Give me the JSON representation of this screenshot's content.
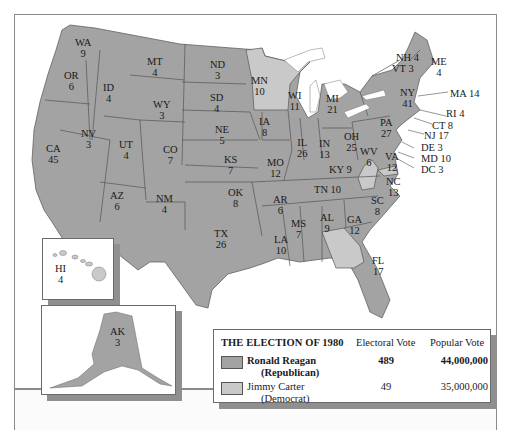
{
  "map": {
    "title": "THE ELECTION OF 1980",
    "colors": {
      "republican": "#a3a3a3",
      "democrat": "#c9c9c9",
      "water": "#ffffff",
      "border": "#555555"
    },
    "states": {
      "WA": {
        "abbr": "WA",
        "ev": "9",
        "winner": "Reagan"
      },
      "OR": {
        "abbr": "OR",
        "ev": "6",
        "winner": "Reagan"
      },
      "CA": {
        "abbr": "CA",
        "ev": "45",
        "winner": "Reagan"
      },
      "NV": {
        "abbr": "NV",
        "ev": "3",
        "winner": "Reagan"
      },
      "ID": {
        "abbr": "ID",
        "ev": "4",
        "winner": "Reagan"
      },
      "MT": {
        "abbr": "MT",
        "ev": "4",
        "winner": "Reagan"
      },
      "WY": {
        "abbr": "WY",
        "ev": "3",
        "winner": "Reagan"
      },
      "UT": {
        "abbr": "UT",
        "ev": "4",
        "winner": "Reagan"
      },
      "AZ": {
        "abbr": "AZ",
        "ev": "6",
        "winner": "Reagan"
      },
      "CO": {
        "abbr": "CO",
        "ev": "7",
        "winner": "Reagan"
      },
      "NM": {
        "abbr": "NM",
        "ev": "4",
        "winner": "Reagan"
      },
      "ND": {
        "abbr": "ND",
        "ev": "3",
        "winner": "Reagan"
      },
      "SD": {
        "abbr": "SD",
        "ev": "4",
        "winner": "Reagan"
      },
      "NE": {
        "abbr": "NE",
        "ev": "5",
        "winner": "Reagan"
      },
      "KS": {
        "abbr": "KS",
        "ev": "7",
        "winner": "Reagan"
      },
      "OK": {
        "abbr": "OK",
        "ev": "8",
        "winner": "Reagan"
      },
      "TX": {
        "abbr": "TX",
        "ev": "26",
        "winner": "Reagan"
      },
      "MN": {
        "abbr": "MN",
        "ev": "10",
        "winner": "Carter"
      },
      "IA": {
        "abbr": "IA",
        "ev": "8",
        "winner": "Reagan"
      },
      "MO": {
        "abbr": "MO",
        "ev": "12",
        "winner": "Reagan"
      },
      "AR": {
        "abbr": "AR",
        "ev": "6",
        "winner": "Reagan"
      },
      "LA": {
        "abbr": "LA",
        "ev": "10",
        "winner": "Reagan"
      },
      "WI": {
        "abbr": "WI",
        "ev": "11",
        "winner": "Reagan"
      },
      "IL": {
        "abbr": "IL",
        "ev": "26",
        "winner": "Reagan"
      },
      "MI": {
        "abbr": "MI",
        "ev": "21",
        "winner": "Reagan"
      },
      "IN": {
        "abbr": "IN",
        "ev": "13",
        "winner": "Reagan"
      },
      "OH": {
        "abbr": "OH",
        "ev": "25",
        "winner": "Reagan"
      },
      "KY": {
        "abbr": "KY",
        "label": "KY 9",
        "ev": "9",
        "winner": "Reagan"
      },
      "TN": {
        "abbr": "TN",
        "label": "TN 10",
        "ev": "10",
        "winner": "Reagan"
      },
      "MS": {
        "abbr": "MS",
        "ev": "7",
        "winner": "Reagan"
      },
      "AL": {
        "abbr": "AL",
        "ev": "9",
        "winner": "Reagan"
      },
      "GA": {
        "abbr": "GA",
        "ev": "12",
        "winner": "Carter"
      },
      "FL": {
        "abbr": "FL",
        "ev": "17",
        "winner": "Reagan"
      },
      "SC": {
        "abbr": "SC",
        "ev": "8",
        "winner": "Reagan"
      },
      "NC": {
        "abbr": "NC",
        "ev": "13",
        "winner": "Reagan"
      },
      "VA": {
        "abbr": "VA",
        "ev": "12",
        "winner": "Reagan"
      },
      "WV": {
        "abbr": "WV",
        "ev": "6",
        "winner": "Carter"
      },
      "PA": {
        "abbr": "PA",
        "ev": "27",
        "winner": "Reagan"
      },
      "NY": {
        "abbr": "NY",
        "ev": "41",
        "winner": "Reagan"
      },
      "ME": {
        "abbr": "ME",
        "ev": "4",
        "winner": "Reagan"
      },
      "NH": {
        "label": "NH 4",
        "ev": "4",
        "winner": "Reagan"
      },
      "VT": {
        "label": "VT 3",
        "ev": "3",
        "winner": "Reagan"
      },
      "MA": {
        "label": "MA 14",
        "ev": "14",
        "winner": "Reagan"
      },
      "RI": {
        "label": "RI 4",
        "ev": "4",
        "winner": "Carter"
      },
      "CT": {
        "label": "CT 8",
        "ev": "8",
        "winner": "Reagan"
      },
      "NJ": {
        "label": "NJ 17",
        "ev": "17",
        "winner": "Reagan"
      },
      "DE": {
        "label": "DE 3",
        "ev": "3",
        "winner": "Reagan"
      },
      "MD": {
        "label": "MD 10",
        "ev": "10",
        "winner": "Carter"
      },
      "DC": {
        "label": "DC 3",
        "ev": "3",
        "winner": "Carter"
      },
      "HI": {
        "abbr": "HI",
        "ev": "4",
        "winner": "Carter"
      },
      "AK": {
        "abbr": "AK",
        "ev": "3",
        "winner": "Reagan"
      }
    }
  },
  "legend": {
    "title": "THE ELECTION OF 1980",
    "col_electoral": "Electoral Vote",
    "col_popular": "Popular Vote",
    "candidates": [
      {
        "name": "Ronald Reagan",
        "party": "(Republican)",
        "electoral": "489",
        "popular": "44,000,000",
        "color": "#a3a3a3"
      },
      {
        "name": "Jimmy Carter",
        "party": "(Democrat)",
        "electoral": "49",
        "popular": "35,000,000",
        "color": "#c9c9c9"
      }
    ]
  }
}
